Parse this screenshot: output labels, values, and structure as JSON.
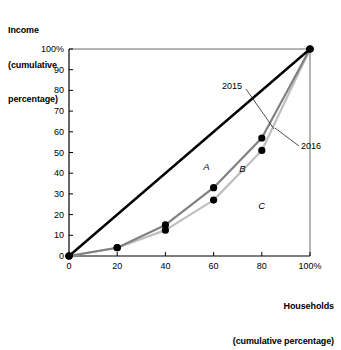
{
  "chart_data": {
    "type": "line",
    "title": "",
    "xlabel": "Households\n(cumulative percentage)",
    "ylabel": "Income\n(cumulative\npercentage)",
    "xlim": [
      0,
      100
    ],
    "ylim": [
      0,
      100
    ],
    "grid": false,
    "legend_position": "inline-annotations",
    "x_ticks": [
      "0",
      "20",
      "40",
      "60",
      "80",
      "100%"
    ],
    "x_tick_values": [
      0,
      20,
      40,
      60,
      80,
      100
    ],
    "y_ticks": [
      "0",
      "10",
      "20",
      "30",
      "40",
      "50",
      "60",
      "70",
      "80",
      "90",
      "100%"
    ],
    "y_tick_values": [
      0,
      10,
      20,
      30,
      40,
      50,
      60,
      70,
      80,
      90,
      100
    ],
    "series": [
      {
        "name": "line of equality",
        "color": "#000000",
        "x": [
          0,
          100
        ],
        "values": [
          0,
          100
        ],
        "markers": [
          0,
          100
        ]
      },
      {
        "name": "2015",
        "color": "#808080",
        "x": [
          0,
          20,
          40,
          60,
          80,
          100
        ],
        "values": [
          0,
          4,
          15,
          33,
          57,
          100
        ]
      },
      {
        "name": "2016",
        "color": "#bfbfbf",
        "x": [
          0,
          20,
          40,
          60,
          80,
          100
        ],
        "values": [
          0,
          4,
          12.5,
          27,
          51,
          100
        ]
      }
    ],
    "annotations": [
      {
        "text": "2015",
        "target_x": 80,
        "target_y": 62
      },
      {
        "text": "2016",
        "target_x": 87,
        "target_y": 62
      },
      {
        "text": "A",
        "x": 57,
        "y": 43
      },
      {
        "text": "B",
        "x": 72,
        "y": 42
      },
      {
        "text": "C",
        "x": 80,
        "y": 24
      }
    ]
  },
  "labels": {
    "y_axis_title_lines": [
      "Income",
      "(cumulative",
      "percentage)"
    ],
    "x_axis_title_lines": [
      "Households",
      "(cumulative percentage)"
    ],
    "series_2015": "2015",
    "series_2016": "2016",
    "region_a": "A",
    "region_b": "B",
    "region_c": "C"
  },
  "colors": {
    "equality_line": "#000000",
    "curve_2015": "#808080",
    "curve_2016": "#bfbfbf",
    "axis": "#555555",
    "marker": "#000000",
    "background": "#ffffff"
  }
}
